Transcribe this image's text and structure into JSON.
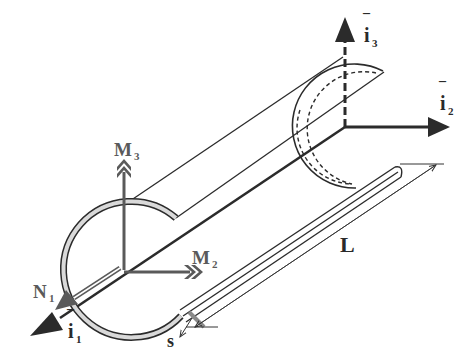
{
  "figure": {
    "type": "diagram",
    "labels": {
      "i1": {
        "base": "i",
        "sub": "1",
        "bar": true
      },
      "i2": {
        "base": "i",
        "sub": "2",
        "bar": true
      },
      "i3": {
        "base": "i",
        "sub": "3",
        "bar": true
      },
      "M3": {
        "base": "M",
        "sub": "3"
      },
      "M2": {
        "base": "M",
        "sub": "2"
      },
      "N1": {
        "base": "N",
        "sub": "1"
      },
      "L": "L",
      "s": "s"
    },
    "colors": {
      "axis": "#2b2b2b",
      "load": "#5a5a5a",
      "wall_fill": "#d9d9d9",
      "background": "#ffffff"
    }
  }
}
